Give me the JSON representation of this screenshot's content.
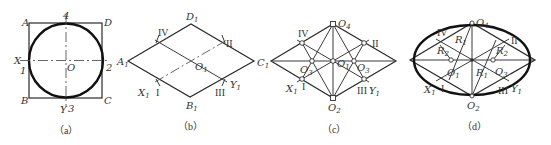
{
  "figure": {
    "panels": [
      {
        "id": "a",
        "caption": "（a）",
        "labels": {
          "A": "A",
          "B": "B",
          "C": "C",
          "D": "D",
          "X": "X",
          "Y": "Y",
          "O": "O",
          "p1": "1",
          "p2": "2",
          "p3": "3",
          "p4": "4"
        }
      },
      {
        "id": "b",
        "caption": "（b）",
        "labels": {
          "A1": "A",
          "B1": "B",
          "C1": "C",
          "D1": "D",
          "X1": "X",
          "Y1": "Y",
          "O1": "O",
          "sub": "1",
          "I": "I",
          "II": "II",
          "III": "III",
          "IV": "IV"
        }
      },
      {
        "id": "c",
        "caption": "（c）",
        "labels": {
          "O1": "O",
          "O2": "O",
          "O3": "O",
          "O4": "O",
          "X1": "X",
          "Y1": "Y",
          "I": "I",
          "II": "II",
          "III": "III",
          "IV": "IV",
          "s1": "1",
          "s2": "2",
          "s3": "3",
          "s4": "4"
        }
      },
      {
        "id": "d",
        "caption": "（d）",
        "labels": {
          "O1": "O",
          "O2": "O",
          "O3": "O",
          "O4": "O",
          "X1": "X",
          "Y1": "Y",
          "R1": "R",
          "R2": "R",
          "I": "I",
          "II": "II",
          "III": "III",
          "IV": "IV",
          "s1": "1",
          "s2": "2",
          "s3": "3",
          "s4": "4"
        }
      }
    ]
  }
}
